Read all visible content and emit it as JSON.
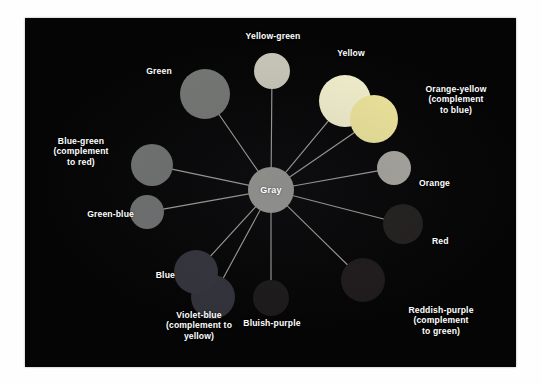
{
  "figure": {
    "type": "color-wheel-diagram",
    "background_color": "#050506",
    "panel": {
      "x": 25,
      "y": 18,
      "width": 491,
      "height": 349
    },
    "page_background": "#ffffff",
    "label_color": "#ffffff",
    "spoke_color": "#b9b9b4"
  },
  "hub": {
    "label": "Gray",
    "color": "#9a9a96",
    "cx": 246,
    "cy": 172,
    "r": 23
  },
  "nodes": [
    {
      "name": "yellow-green",
      "label": "Yellow-green",
      "color": "#c9c7b9",
      "cx": 247,
      "cy": 53,
      "r": 18,
      "label_x": 200,
      "label_y": 13,
      "label_w": 96,
      "label_align": "center"
    },
    {
      "name": "yellow",
      "label": "Yellow",
      "color": "#f2f0cd",
      "cx": 320,
      "cy": 83,
      "r": 26,
      "label_x": 296,
      "label_y": 30,
      "label_w": 60,
      "label_align": "center"
    },
    {
      "name": "orange-yellow",
      "label": "Orange-yellow\n(complement\nto blue)",
      "color": "#eee59c",
      "cx": 349,
      "cy": 101,
      "r": 24,
      "label_x": 378,
      "label_y": 66,
      "label_w": 106,
      "label_align": "center"
    },
    {
      "name": "orange",
      "label": "Orange",
      "color": "#a9a7a1",
      "cx": 369,
      "cy": 150,
      "r": 17,
      "label_x": 394,
      "label_y": 160,
      "label_w": 56,
      "label_align": "left"
    },
    {
      "name": "red",
      "label": "Red",
      "color": "#23201f",
      "cx": 378,
      "cy": 206,
      "r": 20,
      "label_x": 407,
      "label_y": 218,
      "label_w": 40,
      "label_align": "left"
    },
    {
      "name": "reddish-purple",
      "label": "Reddish-purple\n(complement\nto green)",
      "color": "#1f1b1d",
      "cx": 338,
      "cy": 262,
      "r": 22,
      "label_x": 360,
      "label_y": 287,
      "label_w": 112,
      "label_align": "center"
    },
    {
      "name": "bluish-purple",
      "label": "Bluish-purple",
      "color": "#1d1a1c",
      "cx": 246,
      "cy": 280,
      "r": 18,
      "label_x": 203,
      "label_y": 300,
      "label_w": 88,
      "label_align": "center"
    },
    {
      "name": "violet-blue",
      "label": "Violet-blue\n(complement to\nyellow)",
      "color": "#32333a",
      "cx": 188,
      "cy": 279,
      "r": 22,
      "label_x": 115,
      "label_y": 292,
      "label_w": 118,
      "label_align": "center"
    },
    {
      "name": "blue",
      "label": "Blue",
      "color": "#34353c",
      "cx": 171,
      "cy": 254,
      "r": 22,
      "label_x": 110,
      "label_y": 252,
      "label_w": 40,
      "label_align": "right"
    },
    {
      "name": "green-blue",
      "label": "Green-blue",
      "color": "#6f7171",
      "cx": 122,
      "cy": 194,
      "r": 17,
      "label_x": 33,
      "label_y": 191,
      "label_w": 76,
      "label_align": "right"
    },
    {
      "name": "blue-green",
      "label": "Blue-green\n(complement\nto red)",
      "color": "#717272",
      "cx": 127,
      "cy": 147,
      "r": 21,
      "label_x": 12,
      "label_y": 118,
      "label_w": 88,
      "label_align": "center"
    },
    {
      "name": "green",
      "label": "Green",
      "color": "#757775",
      "cx": 180,
      "cy": 76,
      "r": 25,
      "label_x": 105,
      "label_y": 48,
      "label_w": 58,
      "label_align": "center"
    }
  ],
  "chart_data": {
    "type": "scatter",
    "title": "",
    "center": {
      "label": "Gray",
      "x": 246,
      "y": 172
    },
    "categories": [
      "Yellow-green",
      "Yellow",
      "Orange-yellow (complement to blue)",
      "Orange",
      "Red",
      "Reddish-purple (complement to green)",
      "Bluish-purple",
      "Violet-blue (complement to yellow)",
      "Blue",
      "Green-blue",
      "Blue-green (complement to red)",
      "Green"
    ],
    "complement_pairs": [
      [
        "Orange-yellow",
        "blue"
      ],
      [
        "Violet-blue",
        "yellow"
      ],
      [
        "Reddish-purple",
        "green"
      ],
      [
        "Blue-green",
        "red"
      ]
    ]
  }
}
